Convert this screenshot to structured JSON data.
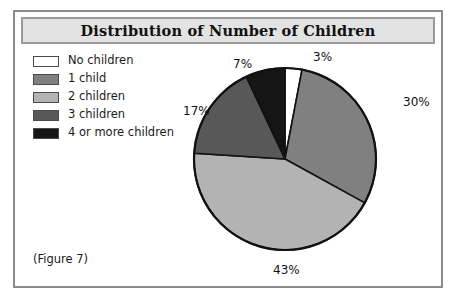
{
  "figure": {
    "title": "Distribution of Number of Children",
    "caption": "(Figure 7)"
  },
  "legend": {
    "items": [
      {
        "label": "No children",
        "color": "#ffffff"
      },
      {
        "label": "1 child",
        "color": "#808080"
      },
      {
        "label": "2 children",
        "color": "#b3b3b3"
      },
      {
        "label": "3 children",
        "color": "#585858"
      },
      {
        "label": "4 or more children",
        "color": "#151515"
      }
    ]
  },
  "labels": {
    "no_children": "3%",
    "one_child": "30%",
    "two_children": "43%",
    "three_children": "17%",
    "four_or_more": "7%"
  },
  "chart_data": {
    "type": "pie",
    "title": "Distribution of Number of Children",
    "categories": [
      "No children",
      "1 child",
      "2 children",
      "3 children",
      "4 or more children"
    ],
    "values": [
      3,
      30,
      43,
      17,
      7
    ],
    "value_labels": [
      "3%",
      "30%",
      "43%",
      "17%",
      "7%"
    ],
    "unit": "percent",
    "colors": [
      "#ffffff",
      "#808080",
      "#b3b3b3",
      "#585858",
      "#151515"
    ],
    "start_angle_deg": 0,
    "direction": "clockwise",
    "legend_position": "top-left",
    "grid": false,
    "xlabel": "",
    "ylabel": ""
  }
}
